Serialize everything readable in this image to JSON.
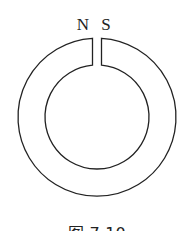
{
  "diagram": {
    "type": "ring magnet with air gap",
    "labels": {
      "north": "N",
      "south": "S"
    },
    "caption": "图 7-10",
    "colors": {
      "stroke": "#222222",
      "background": "#ffffff"
    }
  }
}
